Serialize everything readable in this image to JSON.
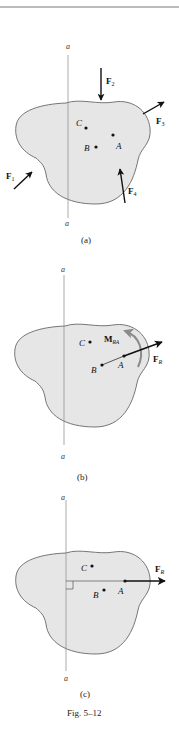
{
  "figure": {
    "caption": "Fig. 5–12",
    "axis_label": "a",
    "colors": {
      "body_fill": "#e6e6e6",
      "outline": "#555555",
      "ink": "#111111",
      "moment_arrow": "#8a8a8a",
      "axis_line": "#888888",
      "top_rule": "#777777"
    },
    "panels": [
      {
        "id": "a",
        "label": "(a)",
        "axis_top": "a",
        "axis_bottom": "a",
        "points": [
          {
            "name": "C"
          },
          {
            "name": "B"
          },
          {
            "name": "A"
          }
        ],
        "forces": [
          {
            "name": "F",
            "sub": "1"
          },
          {
            "name": "F",
            "sub": "2"
          },
          {
            "name": "F",
            "sub": "3"
          },
          {
            "name": "F",
            "sub": "4"
          }
        ]
      },
      {
        "id": "b",
        "label": "(b)",
        "axis_top": "a",
        "axis_bottom": "a",
        "points": [
          {
            "name": "C"
          },
          {
            "name": "B"
          },
          {
            "name": "A"
          }
        ],
        "resultant": {
          "name": "F",
          "sub": "R"
        },
        "moment": {
          "name": "M",
          "sub": "RA"
        }
      },
      {
        "id": "c",
        "label": "(c)",
        "axis_top": "a",
        "axis_bottom": "a",
        "points": [
          {
            "name": "C"
          },
          {
            "name": "B"
          },
          {
            "name": "A"
          }
        ],
        "resultant": {
          "name": "F",
          "sub": "R"
        }
      }
    ]
  }
}
